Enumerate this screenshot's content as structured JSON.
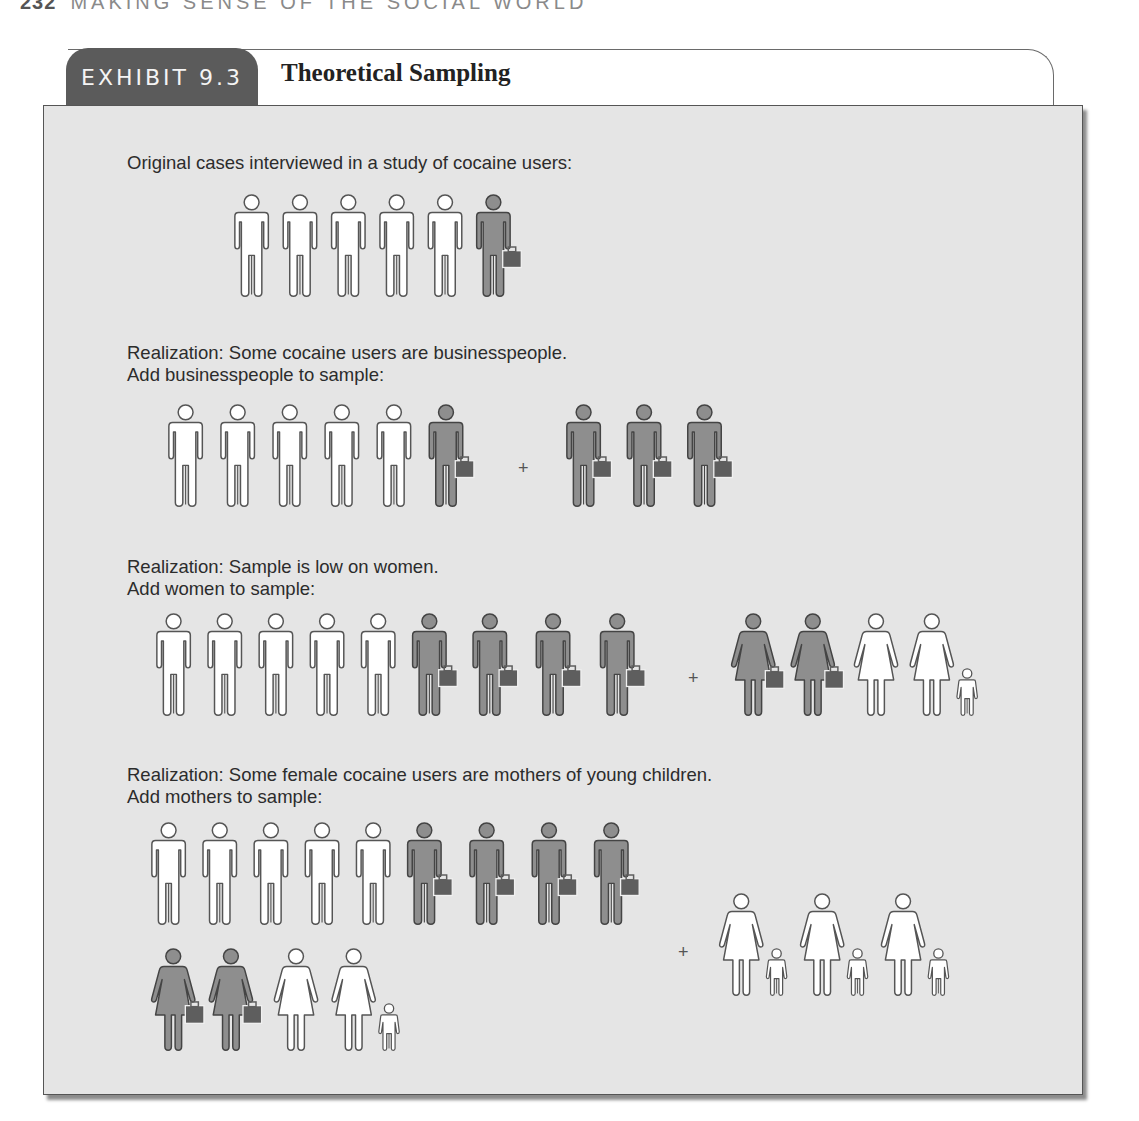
{
  "running_head": {
    "page_number": "232",
    "text": "MAKING SENSE OF THE SOCIAL WORLD"
  },
  "exhibit": {
    "label": "EXHIBIT 9.3",
    "title": "Theoretical Sampling"
  },
  "colors": {
    "tab_bg": "#5b5b5b",
    "panel_bg": "#e5e5e5",
    "figure_white": "#ffffff",
    "figure_gray": "#8e8e8e",
    "briefcase": "#5e5e5e",
    "outline": "#555555"
  },
  "legend_icons": {
    "man": "man-figure-icon",
    "businessman": "businessman-with-briefcase-icon",
    "woman": "woman-figure-icon",
    "businesswoman": "businesswoman-with-briefcase-icon",
    "mother_with_child": "woman-with-child-icon"
  },
  "steps": [
    {
      "caption_lines": [
        "Original cases interviewed in a study of cocaine users:"
      ],
      "base": [
        "man",
        "man",
        "man",
        "man",
        "man",
        "businessman"
      ],
      "added": []
    },
    {
      "caption_lines": [
        "Realization: Some cocaine users are businesspeople.",
        "Add businesspeople to sample:"
      ],
      "base": [
        "man",
        "man",
        "man",
        "man",
        "man",
        "businessman"
      ],
      "plus": "+",
      "added": [
        "businessman",
        "businessman",
        "businessman"
      ]
    },
    {
      "caption_lines": [
        "Realization: Sample is low on women.",
        "Add women to sample:"
      ],
      "base": [
        "man",
        "man",
        "man",
        "man",
        "man",
        "businessman",
        "businessman",
        "businessman",
        "businessman"
      ],
      "plus": "+",
      "added": [
        "businesswoman",
        "businesswoman",
        "woman",
        "mother_with_child"
      ]
    },
    {
      "caption_lines": [
        "Realization: Some female cocaine users are mothers of young children.",
        "Add mothers to sample:"
      ],
      "base": [
        "man",
        "man",
        "man",
        "man",
        "man",
        "businessman",
        "businessman",
        "businessman",
        "businessman",
        "businesswoman",
        "businesswoman",
        "woman",
        "mother_with_child"
      ],
      "plus": "+",
      "added": [
        "mother_with_child",
        "mother_with_child",
        "mother_with_child"
      ]
    }
  ]
}
